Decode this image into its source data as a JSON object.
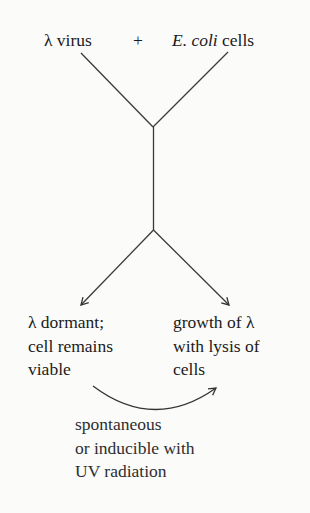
{
  "top": {
    "left_label": "λ virus",
    "plus": "+",
    "right_label_italic": "E. coli",
    "right_label_rest": " cells"
  },
  "outcomes": {
    "left": [
      "λ dormant;",
      "cell remains",
      "viable"
    ],
    "right": [
      "growth of λ",
      "with lysis of",
      "cells"
    ]
  },
  "transition": {
    "label": [
      "spontaneous",
      "or inducible with",
      "UV radiation"
    ]
  },
  "colors": {
    "ink": "#1a1a1a",
    "line": "#333333",
    "background": "#fbfbfa"
  }
}
